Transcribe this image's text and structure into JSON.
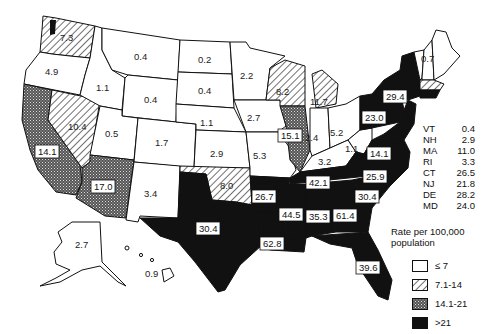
{
  "map": {
    "title": "",
    "states": {
      "WA": "7.3",
      "OR": "4.9",
      "CA": "14.1",
      "NV": "10.4",
      "ID": "1.1",
      "MT": "0.4",
      "WY": "0.4",
      "UT": "0.5",
      "AZ": "17.0",
      "CO": "1.7",
      "NM": "3.4",
      "ND": "0.2",
      "SD": "0.4",
      "NE": "1.1",
      "KS": "2.9",
      "OK": "8.0",
      "TX": "30.4",
      "MN": "2.2",
      "IA": "2.7",
      "MO": "5.3",
      "AR": "26.7",
      "LA": "62.8",
      "WI": "8.2",
      "IL": "15.1",
      "MI": "11.7",
      "IN": "2.4",
      "OH": "5.2",
      "KY": "3.2",
      "TN": "42.1",
      "MS": "44.5",
      "AL": "35.3",
      "GA": "61.4",
      "FL": "39.6",
      "SC": "30.4",
      "NC": "25.9",
      "VA": "14.1",
      "WV": "1.1",
      "PA": "23.0",
      "NY": "29.4",
      "ME": "0.7",
      "AK": "2.7",
      "HI": "0.9"
    },
    "small_states": [
      {
        "abbr": "VT",
        "value": "0.4"
      },
      {
        "abbr": "NH",
        "value": "2.9"
      },
      {
        "abbr": "MA",
        "value": "11.0"
      },
      {
        "abbr": "RI",
        "value": "3.3"
      },
      {
        "abbr": "CT",
        "value": "26.5"
      },
      {
        "abbr": "NJ",
        "value": "21.8"
      },
      {
        "abbr": "DE",
        "value": "28.2"
      },
      {
        "abbr": "MD",
        "value": "24.0"
      }
    ]
  },
  "legend": {
    "title": "Rate per 100,000 population",
    "items": [
      {
        "label": "≤ 7",
        "pattern": "blank"
      },
      {
        "label": "7.1-14",
        "pattern": "hatched"
      },
      {
        "label": "14.1-21",
        "pattern": "dotted"
      },
      {
        "label": ">21",
        "pattern": "solid"
      }
    ]
  },
  "colors": {
    "ink": "#111111",
    "paper": "#ffffff"
  }
}
